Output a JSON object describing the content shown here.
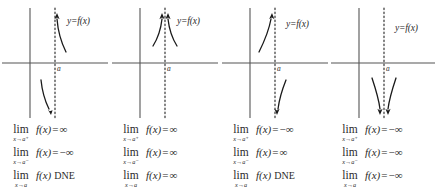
{
  "figure": {
    "axis_color": "#555555",
    "curve_color": "#1a1a1a",
    "asymptote_color": "#333333",
    "background": "#ffffff"
  },
  "labels": {
    "function_label": "y=f(x)",
    "asymptote_point": "a",
    "lim_operator": "lim",
    "dne": "DNE",
    "equals": "=",
    "infinity": "∞",
    "neg_infinity": "−∞",
    "sub_right": "x→a⁺",
    "sub_left": "x→a⁻",
    "sub_two_sided": "x→a"
  },
  "panels": [
    {
      "id": "panel-1",
      "function_label": "y=f(x)",
      "asymptote_point": "a",
      "right_branch": "up",
      "left_branch": "down",
      "limits": [
        {
          "operator": "lim",
          "subscript": "x→a⁺",
          "body": "f(x)",
          "equals": "=",
          "value": "∞",
          "dne": ""
        },
        {
          "operator": "lim",
          "subscript": "x→a⁻",
          "body": "f(x)",
          "equals": "=",
          "value": "−∞",
          "dne": ""
        },
        {
          "operator": "lim",
          "subscript": "x→a",
          "body": "f(x)",
          "equals": "",
          "value": "",
          "dne": "DNE"
        }
      ]
    },
    {
      "id": "panel-2",
      "function_label": "y=f(x)",
      "asymptote_point": "a",
      "right_branch": "up",
      "left_branch": "up",
      "limits": [
        {
          "operator": "lim",
          "subscript": "x→a⁺",
          "body": "f(x)",
          "equals": "=",
          "value": "∞",
          "dne": ""
        },
        {
          "operator": "lim",
          "subscript": "x→a⁻",
          "body": "f(x)",
          "equals": "=",
          "value": "∞",
          "dne": ""
        },
        {
          "operator": "lim",
          "subscript": "x→a",
          "body": "f(x)",
          "equals": "=",
          "value": "∞",
          "dne": ""
        }
      ]
    },
    {
      "id": "panel-3",
      "function_label": "y=f(x)",
      "asymptote_point": "a",
      "right_branch": "down",
      "left_branch": "up",
      "limits": [
        {
          "operator": "lim",
          "subscript": "x→a⁺",
          "body": "f(x)",
          "equals": "=",
          "value": "−∞",
          "dne": ""
        },
        {
          "operator": "lim",
          "subscript": "x→a⁻",
          "body": "f(x)",
          "equals": "=",
          "value": "∞",
          "dne": ""
        },
        {
          "operator": "lim",
          "subscript": "x→a",
          "body": "f(x)",
          "equals": "",
          "value": "",
          "dne": "DNE"
        }
      ]
    },
    {
      "id": "panel-4",
      "function_label": "y=f(x)",
      "asymptote_point": "a",
      "right_branch": "down",
      "left_branch": "down",
      "limits": [
        {
          "operator": "lim",
          "subscript": "x→a⁺",
          "body": "f(x)",
          "equals": "=",
          "value": "−∞",
          "dne": ""
        },
        {
          "operator": "lim",
          "subscript": "x→a⁻",
          "body": "f(x)",
          "equals": "=",
          "value": "−∞",
          "dne": ""
        },
        {
          "operator": "lim",
          "subscript": "x→a",
          "body": "f(x)",
          "equals": "=",
          "value": "−∞",
          "dne": ""
        }
      ]
    }
  ]
}
